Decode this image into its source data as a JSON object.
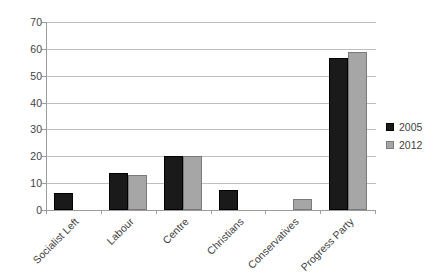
{
  "chart_data": {
    "type": "bar",
    "title": "",
    "subtitle": "",
    "xlabel": "",
    "ylabel": "",
    "ylim": [
      0,
      70
    ],
    "ytick_step": 10,
    "yticks": [
      0,
      10,
      20,
      30,
      40,
      50,
      60,
      70
    ],
    "ytick_labels": [
      "0",
      "10",
      "20",
      "30",
      "40",
      "50",
      "60",
      "70"
    ],
    "grid": true,
    "grid_axis": "y",
    "legend_position": "right",
    "categories": [
      "Socialist Left",
      "Labour",
      "Centre",
      "Christians",
      "Conservatives",
      "Progress Party"
    ],
    "series": [
      {
        "name": "2005",
        "color": "#1a1a1a",
        "values": [
          6.3,
          13.8,
          20.0,
          7.4,
          0,
          56.6
        ]
      },
      {
        "name": "2012",
        "color": "#a6a6a6",
        "values": [
          0,
          13.0,
          20.0,
          0,
          4.1,
          58.8
        ]
      }
    ]
  },
  "legend": {
    "items": [
      {
        "label": "2005",
        "color": "#1a1a1a"
      },
      {
        "label": "2012",
        "color": "#a6a6a6"
      }
    ]
  },
  "colors": {
    "series_2005": "#1a1a1a",
    "series_2012": "#a6a6a6",
    "gridline": "#bfbfbf",
    "axis": "#9c9c9c",
    "text": "#3f3f3f",
    "background": "#ffffff"
  }
}
